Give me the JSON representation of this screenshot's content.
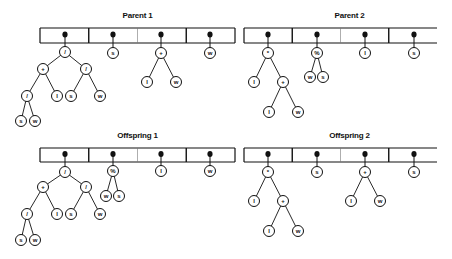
{
  "panels": [
    {
      "id": "parent-1",
      "title": "Parent 1",
      "box": {
        "x": 40,
        "y": 28,
        "w": 195,
        "h": 15,
        "open_right": false
      },
      "slots": [
        {
          "x": 65,
          "tree": {
            "label": "/",
            "x": 65,
            "y": 52,
            "children": [
              {
                "label": "+",
                "x": 43,
                "y": 69,
                "children": [
                  {
                    "label": "/",
                    "x": 27,
                    "y": 96,
                    "children": [
                      {
                        "label": "s",
                        "x": 21,
                        "y": 121
                      },
                      {
                        "label": "w",
                        "x": 35,
                        "y": 121
                      }
                    ]
                  },
                  {
                    "label": "l",
                    "x": 57,
                    "y": 96
                  }
                ]
              },
              {
                "label": "/",
                "x": 86,
                "y": 69,
                "children": [
                  {
                    "label": "s",
                    "x": 71,
                    "y": 96
                  },
                  {
                    "label": "w",
                    "x": 100,
                    "y": 96
                  }
                ]
              }
            ]
          }
        },
        {
          "x": 113,
          "tree": {
            "label": "s",
            "x": 113,
            "y": 53
          }
        },
        {
          "x": 161,
          "tree": {
            "label": "+",
            "x": 161,
            "y": 53,
            "children": [
              {
                "label": "l",
                "x": 147,
                "y": 82
              },
              {
                "label": "w",
                "x": 176,
                "y": 82
              }
            ]
          }
        },
        {
          "x": 210,
          "tree": {
            "label": "w",
            "x": 210,
            "y": 53
          }
        }
      ]
    },
    {
      "id": "parent-2",
      "title": "Parent 2",
      "box": {
        "x": 244,
        "y": 28,
        "w": 193,
        "h": 15,
        "open_right": true
      },
      "slots": [
        {
          "x": 268,
          "tree": {
            "label": "*",
            "x": 268,
            "y": 53,
            "children": [
              {
                "label": "l",
                "x": 254,
                "y": 82
              },
              {
                "label": "+",
                "x": 283,
                "y": 82,
                "children": [
                  {
                    "label": "l",
                    "x": 269,
                    "y": 112
                  },
                  {
                    "label": "w",
                    "x": 298,
                    "y": 112
                  }
                ]
              }
            ]
          }
        },
        {
          "x": 317,
          "tree": {
            "label": "%",
            "x": 317,
            "y": 53,
            "children": [
              {
                "label": "w",
                "x": 310,
                "y": 77
              },
              {
                "label": "s",
                "x": 323,
                "y": 77
              }
            ]
          }
        },
        {
          "x": 365,
          "tree": {
            "label": "l",
            "x": 365,
            "y": 53
          }
        },
        {
          "x": 414,
          "tree": {
            "label": "s",
            "x": 414,
            "y": 53
          }
        }
      ]
    },
    {
      "id": "offspring-1",
      "title": "Offspring 1",
      "box": {
        "x": 40,
        "y": 148,
        "w": 195,
        "h": 14,
        "open_right": false
      },
      "slots": [
        {
          "x": 65,
          "tree": {
            "label": "/",
            "x": 65,
            "y": 172,
            "children": [
              {
                "label": "+",
                "x": 43,
                "y": 187,
                "children": [
                  {
                    "label": "/",
                    "x": 27,
                    "y": 214,
                    "children": [
                      {
                        "label": "s",
                        "x": 21,
                        "y": 240
                      },
                      {
                        "label": "w",
                        "x": 35,
                        "y": 240
                      }
                    ]
                  },
                  {
                    "label": "l",
                    "x": 57,
                    "y": 214
                  }
                ]
              },
              {
                "label": "/",
                "x": 86,
                "y": 187,
                "children": [
                  {
                    "label": "s",
                    "x": 71,
                    "y": 214
                  },
                  {
                    "label": "w",
                    "x": 100,
                    "y": 214
                  }
                ]
              }
            ]
          }
        },
        {
          "x": 113,
          "tree": {
            "label": "%",
            "x": 113,
            "y": 171,
            "children": [
              {
                "label": "w",
                "x": 106,
                "y": 196
              },
              {
                "label": "s",
                "x": 119,
                "y": 196
              }
            ]
          }
        },
        {
          "x": 161,
          "tree": {
            "label": "l",
            "x": 161,
            "y": 171
          }
        },
        {
          "x": 210,
          "tree": {
            "label": "w",
            "x": 210,
            "y": 171
          }
        }
      ]
    },
    {
      "id": "offspring-2",
      "title": "Offspring 2",
      "box": {
        "x": 244,
        "y": 148,
        "w": 193,
        "h": 14,
        "open_right": true
      },
      "slots": [
        {
          "x": 268,
          "tree": {
            "label": "*",
            "x": 268,
            "y": 172,
            "children": [
              {
                "label": "l",
                "x": 254,
                "y": 201
              },
              {
                "label": "+",
                "x": 283,
                "y": 201,
                "children": [
                  {
                    "label": "l",
                    "x": 269,
                    "y": 231
                  },
                  {
                    "label": "w",
                    "x": 298,
                    "y": 231
                  }
                ]
              }
            ]
          }
        },
        {
          "x": 317,
          "tree": {
            "label": "s",
            "x": 317,
            "y": 172
          }
        },
        {
          "x": 365,
          "tree": {
            "label": "+",
            "x": 365,
            "y": 172,
            "children": [
              {
                "label": "l",
                "x": 351,
                "y": 201
              },
              {
                "label": "w",
                "x": 380,
                "y": 201
              }
            ]
          }
        },
        {
          "x": 414,
          "tree": {
            "label": "s",
            "x": 414,
            "y": 172
          }
        }
      ]
    }
  ],
  "colors": {
    "ink": "#111111",
    "background": "#ffffff",
    "divider_light": "#777777"
  }
}
